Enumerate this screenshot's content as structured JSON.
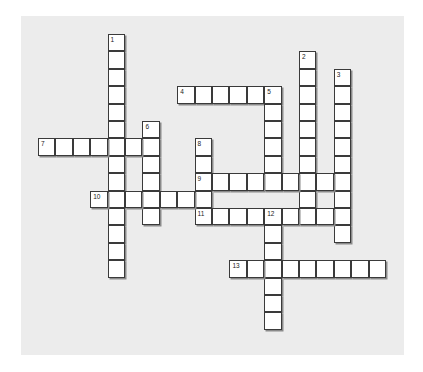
{
  "puzzle": {
    "type": "crossword",
    "colors": {
      "background": "#ececec",
      "cell": "#ffffff",
      "border": "#3a3a3a"
    },
    "entries": [
      {
        "number": "1",
        "direction": "down",
        "row": 0,
        "col": 4,
        "length": 14
      },
      {
        "number": "2",
        "direction": "down",
        "row": 1,
        "col": 15,
        "length": 10
      },
      {
        "number": "3",
        "direction": "down",
        "row": 2,
        "col": 17,
        "length": 10
      },
      {
        "number": "4",
        "direction": "across",
        "row": 3,
        "col": 8,
        "length": 6
      },
      {
        "number": "5",
        "direction": "down",
        "row": 3,
        "col": 13,
        "length": 6
      },
      {
        "number": "6",
        "direction": "down",
        "row": 5,
        "col": 6,
        "length": 6
      },
      {
        "number": "7",
        "direction": "across",
        "row": 6,
        "col": 0,
        "length": 7
      },
      {
        "number": "8",
        "direction": "down",
        "row": 6,
        "col": 9,
        "length": 5
      },
      {
        "number": "9",
        "direction": "across",
        "row": 8,
        "col": 9,
        "length": 9
      },
      {
        "number": "10",
        "direction": "across",
        "row": 9,
        "col": 3,
        "length": 7
      },
      {
        "number": "11",
        "direction": "across",
        "row": 10,
        "col": 9,
        "length": 9
      },
      {
        "number": "12",
        "direction": "down",
        "row": 10,
        "col": 13,
        "length": 7
      },
      {
        "number": "13",
        "direction": "across",
        "row": 13,
        "col": 11,
        "length": 9
      }
    ]
  }
}
